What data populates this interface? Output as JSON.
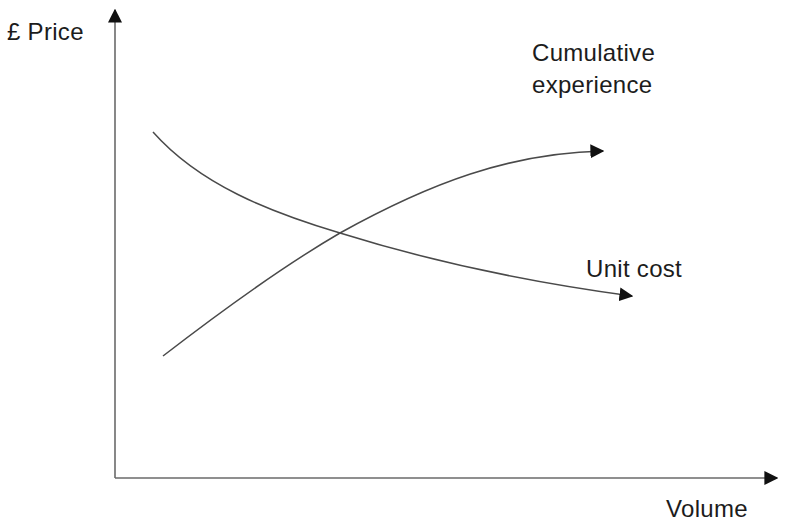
{
  "diagram": {
    "type": "experience-curve",
    "axes": {
      "y_label": "£ Price",
      "x_label": "Volume"
    },
    "curves": [
      {
        "name": "Cumulative experience",
        "label_line1": "Cumulative",
        "label_line2": "experience",
        "direction": "increasing",
        "points_px": [
          [
            163,
            356
          ],
          [
            250,
            290
          ],
          [
            340,
            233
          ],
          [
            460,
            176
          ],
          [
            600,
            151
          ]
        ]
      },
      {
        "name": "Unit cost",
        "label": "Unit cost",
        "direction": "decreasing",
        "points_px": [
          [
            153,
            132
          ],
          [
            240,
            195
          ],
          [
            340,
            233
          ],
          [
            480,
            272
          ],
          [
            630,
            296
          ]
        ]
      }
    ],
    "colors": {
      "line": "#4a4a4a",
      "axis": "#6a6a6a",
      "arrowhead": "#111111",
      "text": "#1c1c1c",
      "background": "#ffffff"
    }
  }
}
